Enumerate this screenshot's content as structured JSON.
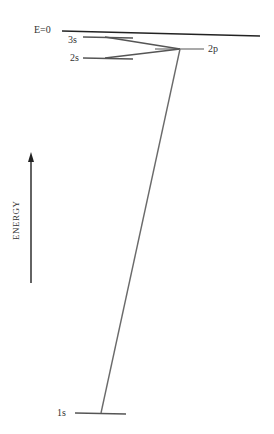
{
  "diagram": {
    "zero_level_label": "E=0",
    "axis_label": "ENERGY",
    "levels": [
      {
        "id": "3s",
        "label": "3s"
      },
      {
        "id": "2s",
        "label": "2s"
      },
      {
        "id": "2p",
        "label": "2p"
      },
      {
        "id": "1s",
        "label": "1s"
      }
    ],
    "transitions": [
      {
        "from": "3s",
        "to": "2p"
      },
      {
        "from": "2s",
        "to": "2p"
      },
      {
        "from": "2p",
        "to": "1s"
      }
    ],
    "colors": {
      "line": "#555555",
      "zero_line": "#222222",
      "text": "#333333"
    }
  }
}
